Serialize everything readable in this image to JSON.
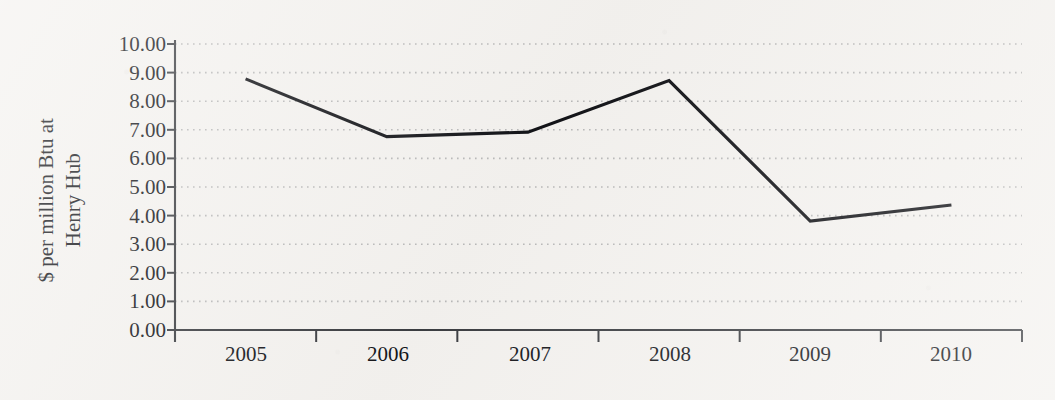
{
  "chart_data": {
    "type": "line",
    "title": "",
    "subtitle": "",
    "xlabel": "",
    "ylabel": "$ per million Btu at Henry Hub",
    "ylabel_line1": "$ per million Btu at",
    "ylabel_line2": "Henry Hub",
    "categories": [
      "2005",
      "2006",
      "2007",
      "2008",
      "2009",
      "2010"
    ],
    "values": [
      8.78,
      6.76,
      6.92,
      8.72,
      3.81,
      4.37
    ],
    "series": [
      {
        "name": "Henry Hub natural gas price",
        "values": [
          8.78,
          6.76,
          6.92,
          8.72,
          3.81,
          4.37
        ]
      }
    ],
    "ylim": [
      0,
      10
    ],
    "ytick_step": 1,
    "ytick_labels": [
      "10.00",
      "9.00",
      "8.00",
      "7.00",
      "6.00",
      "5.00",
      "4.00",
      "3.00",
      "2.00",
      "1.00",
      "0.00"
    ],
    "ytick_values": [
      10,
      9,
      8,
      7,
      6,
      5,
      4,
      3,
      2,
      1,
      0
    ],
    "xtick_labels": [
      "2005",
      "2006",
      "2007",
      "2008",
      "2009",
      "2010"
    ],
    "grid": "horizontal-dotted",
    "legend": "none",
    "legend_position": "none",
    "line_color": "#121317",
    "grid_color": "#b9b9b9",
    "axis_color": "#3b3d41",
    "background_color": "#f4f2ef"
  }
}
